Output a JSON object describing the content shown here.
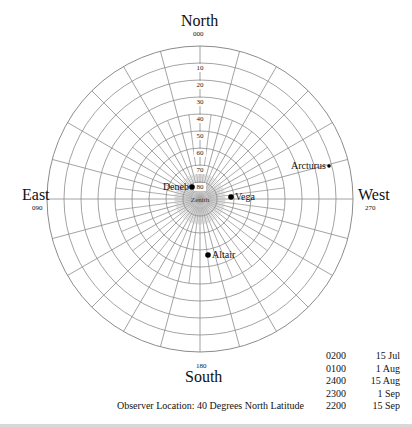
{
  "directions": {
    "north": {
      "label": "North",
      "azimuth": "000"
    },
    "east": {
      "label": "East",
      "azimuth": "090"
    },
    "west": {
      "label": "West",
      "azimuth": "270"
    },
    "south": {
      "label": "South",
      "azimuth": "180"
    }
  },
  "altitude_rings": [
    "10",
    "20",
    "30",
    "40",
    "50",
    "60",
    "70",
    "80"
  ],
  "zenith_label": "Zenith",
  "stars": [
    {
      "name": "Deneb",
      "x": 192,
      "y": 187,
      "label_side": "left"
    },
    {
      "name": "Vega",
      "x": 231,
      "y": 197,
      "label_side": "right"
    },
    {
      "name": "Arcturus",
      "x": 329,
      "y": 166,
      "label_side": "left"
    },
    {
      "name": "Altair",
      "x": 208,
      "y": 255,
      "label_side": "right"
    }
  ],
  "observation_times": [
    {
      "time": "0200",
      "date": "15 Jul"
    },
    {
      "time": "0100",
      "date": "1 Aug"
    },
    {
      "time": "2400",
      "date": "15 Aug"
    },
    {
      "time": "2300",
      "date": "1 Sep"
    },
    {
      "time": "2200",
      "date": "15 Sep"
    }
  ],
  "observer_location": "Observer Location: 40 Degrees North Latitude",
  "colors": {
    "grid": "#8c8c8c",
    "text": "#111111",
    "background": "#ffffff"
  },
  "chart_data": {
    "type": "polar-sky-chart",
    "center": [
      200,
      199
    ],
    "radius": 153,
    "ring_step_deg": 10,
    "spoke_step_deg": 15
  }
}
